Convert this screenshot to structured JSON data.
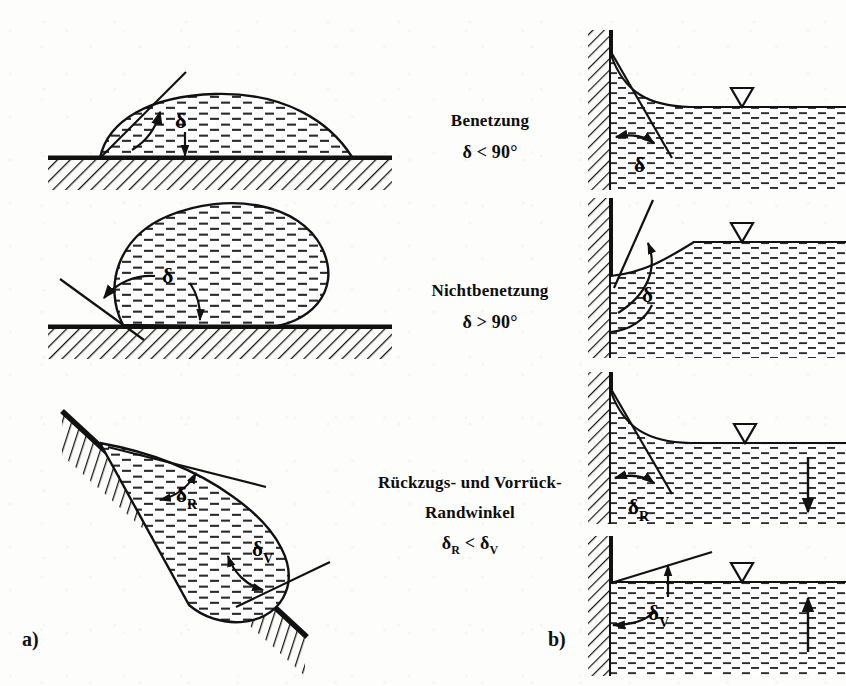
{
  "figure": {
    "title_implicit": "Randwinkel / Kontaktwinkel",
    "panels": [
      {
        "id": "a",
        "label": "a)"
      },
      {
        "id": "b",
        "label": "b)"
      }
    ],
    "captions": [
      {
        "id": "wetting",
        "line1": "Benetzung",
        "line2": "",
        "formula_symbol": "δ",
        "formula": "δ < 90°",
        "relation": "<",
        "value": "90°"
      },
      {
        "id": "non-wetting",
        "line1": "Nichtbenetzung",
        "line2": "",
        "formula_symbol": "δ",
        "formula": "δ > 90°",
        "relation": ">",
        "value": "90°"
      },
      {
        "id": "receding-advancing",
        "line1": "Rückzugs-  und  Vorrück-",
        "line2": "Randwinkel",
        "formula_symbol": "δ",
        "formula": "δR < δV",
        "relation": "<",
        "sub_left": "R",
        "sub_right": "V"
      }
    ],
    "angle_labels": {
      "delta": "δ",
      "delta_R_base": "δ",
      "delta_R_sub": "R",
      "delta_V_base": "δ",
      "delta_V_sub": "V"
    },
    "left_diagrams": [
      {
        "id": "drop-wetting",
        "description": "Liquid drop with contact angle below 90 degrees on horizontal hatched solid",
        "angle_label": "δ"
      },
      {
        "id": "drop-non-wetting",
        "description": "Rounded liquid drop with contact angle above 90 degrees on horizontal hatched solid",
        "angle_label": "δ"
      },
      {
        "id": "drop-inclined",
        "description": "Liquid drop on inclined hatched plane showing receding and advancing contact angles",
        "angle_label_receding": "δ",
        "angle_label_advancing": "δ"
      }
    ],
    "right_diagrams": [
      {
        "id": "wall-wetting",
        "description": "Vertical hatched wall with liquid rising, concave meniscus, water level marker",
        "angle_label": "δ",
        "level_marker": "▽",
        "flow_arrow": "none"
      },
      {
        "id": "wall-non-wetting",
        "description": "Vertical hatched wall with depressed convex meniscus, water level marker",
        "angle_label": "δ",
        "level_marker": "▽",
        "flow_arrow": "none"
      },
      {
        "id": "wall-receding",
        "description": "Vertical hatched wall with concave meniscus and falling water level",
        "angle_label_base": "δ",
        "angle_label_sub": "R",
        "level_marker": "▽",
        "flow_arrow": "down"
      },
      {
        "id": "wall-advancing",
        "description": "Vertical hatched wall with rising water level and advancing contact angle",
        "angle_label_base": "δ",
        "angle_label_sub": "V",
        "level_marker": "▽",
        "flow_arrow": "up"
      }
    ],
    "colors": {
      "ink": "#111111",
      "paper": "#fdfdfb",
      "hatch": "#1a1a1a",
      "liquid_dash": "#2b2b2b"
    }
  }
}
